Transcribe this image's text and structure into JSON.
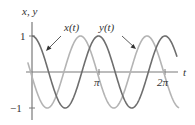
{
  "chart_data": {
    "type": "line",
    "title": "",
    "xlabel": "t",
    "ylabel": "x, y",
    "xlim": [
      -0.2,
      6.9
    ],
    "ylim": [
      -1.25,
      1.25
    ],
    "grid": false,
    "legend": "annotations with arrows",
    "x_ticks": [
      {
        "value": 3.14159,
        "label": "π"
      },
      {
        "value": 6.28318,
        "label": "2π"
      }
    ],
    "y_ticks": [
      {
        "value": 1,
        "label": "1"
      },
      {
        "value": -1,
        "label": "−1"
      }
    ],
    "series": [
      {
        "name": "x(t)",
        "formula": "cos(2t)",
        "color": "#6e6e6e",
        "t_range": [
          0,
          6.85
        ]
      },
      {
        "name": "y(t)",
        "formula": "cos(2t + 1.7)",
        "color": "#b4b4b4",
        "t_range": [
          -0.2,
          6.95
        ]
      }
    ],
    "annotations": [
      {
        "text": "x(t)",
        "points_to": "x(t) curve near t≈0.4"
      },
      {
        "text": "y(t)",
        "points_to": "y(t) curve near t≈4.7"
      }
    ]
  },
  "labels": {
    "axis_y": "x, y",
    "axis_x": "t",
    "tick_y_pos": "1",
    "tick_y_neg": "−1",
    "tick_pi": "π",
    "tick_2pi": "2π",
    "legend_x": "x(t)",
    "legend_y": "y(t)"
  }
}
